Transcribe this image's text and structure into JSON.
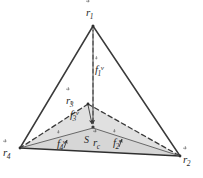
{
  "figure": {
    "background_color": "#ffffff",
    "stroke_color": "#3a3a3a",
    "fill_color": "#d8d8d8",
    "fill_opacity": 0.55,
    "width": 203,
    "height": 178
  },
  "labels": {
    "r1": {
      "symbol": "r",
      "subscript": "1",
      "superscript": "",
      "accent": "vector-arrow",
      "text": "r⃗1"
    },
    "r2": {
      "symbol": "r",
      "subscript": "2",
      "superscript": "",
      "accent": "vector-arrow",
      "text": "r⃗2"
    },
    "r3": {
      "symbol": "r",
      "subscript": "3",
      "superscript": "",
      "accent": "vector-arrow",
      "text": "r⃗3"
    },
    "r4": {
      "symbol": "r",
      "subscript": "4",
      "superscript": "",
      "accent": "vector-arrow",
      "text": "r⃗4"
    },
    "rc": {
      "symbol": "r",
      "subscript": "c",
      "superscript": "",
      "accent": "vector-arrow",
      "text": "r⃗c"
    },
    "f1v": {
      "symbol": "f",
      "subscript": "1",
      "superscript": "v",
      "accent": "vector-arrow",
      "text": "f⃗1ᵛ"
    },
    "f2v": {
      "symbol": "f",
      "subscript": "2",
      "superscript": "v",
      "accent": "vector-arrow",
      "text": "f⃗2ᵛ"
    },
    "f3v": {
      "symbol": "f",
      "subscript": "3",
      "superscript": "v",
      "accent": "vector-arrow",
      "text": "f⃗3ᵛ"
    },
    "f4v": {
      "symbol": "f",
      "subscript": "4",
      "superscript": "v",
      "accent": "vector-arrow",
      "text": "f⃗4ᵛ"
    },
    "s": {
      "symbol": "S",
      "subscript": "",
      "superscript": "",
      "accent": "none",
      "text": "S"
    }
  },
  "geometry": {
    "vertices": {
      "r1": {
        "x": 93,
        "y": 25,
        "name": "apex-vertex"
      },
      "r2": {
        "x": 180,
        "y": 156,
        "name": "bottom-right-vertex"
      },
      "r3": {
        "x": 88,
        "y": 104,
        "name": "back-vertex"
      },
      "r4": {
        "x": 20,
        "y": 148,
        "name": "bottom-left-vertex"
      }
    },
    "centroid": {
      "x": 93,
      "y": 128,
      "name": "centroid-point"
    },
    "solid_edges": [
      {
        "from": "r1",
        "to": "r4"
      },
      {
        "from": "r1",
        "to": "r2"
      },
      {
        "from": "r4",
        "to": "r2"
      }
    ],
    "dashed_edges": [
      {
        "from": "r3",
        "to": "r4"
      },
      {
        "from": "r3",
        "to": "r2"
      },
      {
        "from": "r1",
        "to": "centroid"
      }
    ],
    "thin_edges": [
      {
        "from": "r3",
        "to": "centroid"
      },
      {
        "from": "centroid",
        "to": "r4"
      },
      {
        "from": "centroid",
        "to": "r2"
      }
    ],
    "shaded_face": [
      "r3",
      "r4",
      "r2"
    ],
    "normal_arrows": [
      {
        "name": "f1v-arrow",
        "from": {
          "x": 93,
          "y": 27
        },
        "to": {
          "x": 93,
          "y": 126
        }
      },
      {
        "name": "f3v-arrow",
        "from": {
          "x": 88,
          "y": 105
        },
        "to": {
          "x": 92,
          "y": 126
        }
      },
      {
        "name": "f4v-arrow",
        "from": {
          "x": 63,
          "y": 147
        },
        "to": {
          "x": 66,
          "y": 139
        }
      },
      {
        "name": "f2v-arrow",
        "from": {
          "x": 118,
          "y": 145
        },
        "to": {
          "x": 121,
          "y": 137
        }
      }
    ]
  }
}
